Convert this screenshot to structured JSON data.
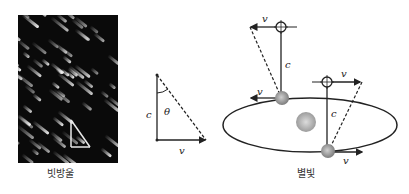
{
  "raindrop_panel": {
    "caption": "빗방울",
    "streak_count": 70
  },
  "triangle": {
    "labels": {
      "vertical": "c",
      "angle": "θ",
      "horizontal": "v"
    }
  },
  "starlight_panel": {
    "caption": "별빛",
    "labels": {
      "star1_velocity": "v",
      "earth1_velocity": "v",
      "light1": "c",
      "star2_velocity": "v",
      "earth2_velocity": "v",
      "light2": "c"
    }
  },
  "colors": {
    "line": "#222222",
    "photo_bg": "#0a0a0a",
    "sun": "#b8b8b8",
    "earth": "#9a9a9a"
  }
}
